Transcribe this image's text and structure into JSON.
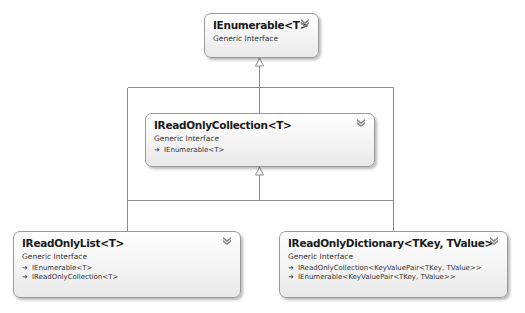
{
  "diagram": {
    "type": "class-diagram",
    "colors": {
      "box_border": "#9a9a9a",
      "box_fill_top": "#ffffff",
      "box_fill_bottom": "#e9e9e9",
      "connector": "#8c8c8c",
      "title_text": "#1a1a1a",
      "body_text": "#333333"
    },
    "nodes": [
      {
        "id": "ienumerable",
        "title": "IEnumerable<T>",
        "kind": "Generic Interface",
        "bases": []
      },
      {
        "id": "ireadonlycollection",
        "title": "IReadOnlyCollection<T>",
        "kind": "Generic Interface",
        "bases": [
          "IEnumerable<T>"
        ]
      },
      {
        "id": "ireadonlylist",
        "title": "IReadOnlyList<T>",
        "kind": "Generic Interface",
        "bases": [
          "IEnumerable<T>",
          "IReadOnlyCollection<T>"
        ]
      },
      {
        "id": "ireadonlydictionary",
        "title": "IReadOnlyDictionary<TKey, TValue>",
        "kind": "Generic Interface",
        "bases": [
          "IReadOnlyCollection<KeyValuePair<TKey,  TValue>>",
          "IEnumerable<KeyValuePair<TKey,  TValue>>"
        ]
      }
    ],
    "edges": [
      {
        "from": "ireadonlycollection",
        "to": "ienumerable",
        "type": "inheritance"
      },
      {
        "from": "ireadonlylist",
        "to": "ienumerable",
        "type": "inheritance"
      },
      {
        "from": "ireadonlydictionary",
        "to": "ienumerable",
        "type": "inheritance"
      },
      {
        "from": "ireadonlylist",
        "to": "ireadonlycollection",
        "type": "inheritance"
      },
      {
        "from": "ireadonlydictionary",
        "to": "ireadonlycollection",
        "type": "inheritance"
      }
    ],
    "icons": {
      "collapse": "double-chevron-down-icon",
      "inherit": "arrow-right-icon",
      "inherit_glyph": "➜"
    }
  }
}
